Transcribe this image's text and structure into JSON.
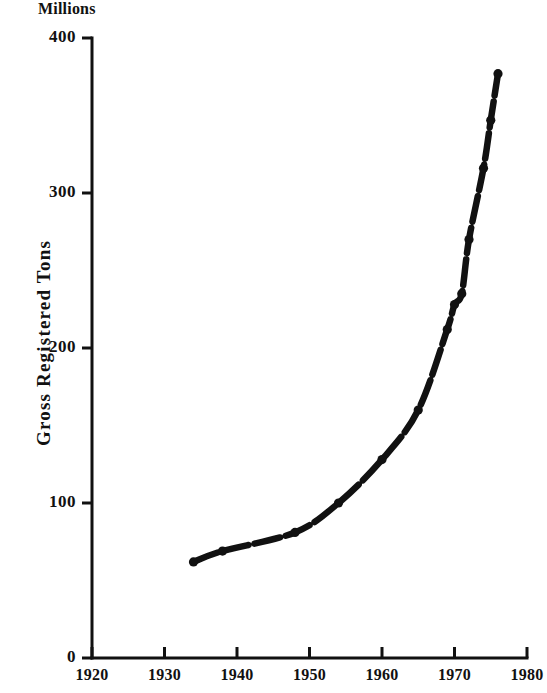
{
  "chart_data": {
    "type": "line",
    "title": "",
    "subtitle": "",
    "units_caption": "Millions",
    "xlabel": "",
    "ylabel": "Gross Registered Tons",
    "xlim": [
      1920,
      1980
    ],
    "ylim": [
      0,
      400
    ],
    "grid": false,
    "legend": null,
    "x_ticks": [
      1920,
      1930,
      1940,
      1950,
      1960,
      1970,
      1980
    ],
    "x_tick_labels": [
      "1920",
      "1930",
      "1940",
      "1950",
      "1960",
      "1970",
      "1980"
    ],
    "y_ticks": [
      0,
      100,
      200,
      300,
      400
    ],
    "y_tick_labels": [
      "0",
      "100",
      "200",
      "300",
      "400"
    ],
    "marker": "dot",
    "line_style": "dashed",
    "line_color": "#111111",
    "series": [
      {
        "name": "Gross Registered Tons",
        "x": [
          1934,
          1938,
          1948,
          1954,
          1960,
          1965,
          1969,
          1970,
          1971,
          1972,
          1974,
          1975,
          1976
        ],
        "values": [
          62,
          69,
          81,
          100,
          128,
          160,
          212,
          228,
          235,
          270,
          316,
          347,
          377
        ]
      }
    ]
  },
  "axes": {
    "units_caption": "Millions",
    "y_title": "Gross Registered Tons"
  }
}
